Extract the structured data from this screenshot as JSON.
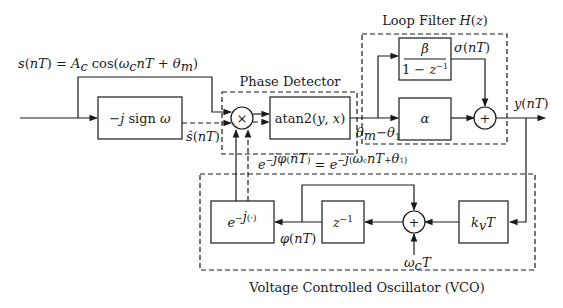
{
  "diagram": {
    "type": "block-diagram",
    "groups": {
      "phase_detector": "Phase Detector",
      "loop_filter": "Loop Filter H(z)",
      "vco": "Voltage Controlled Oscillator (VCO)"
    },
    "signals": {
      "input": "s(nT) = A_c cos(ω_c nT + θ_m)",
      "hilbert_out": "ŝ(nT)",
      "phase_error": "θ_m − θ_1",
      "integrator_out": "σ(nT)",
      "filter_out": "y(nT)",
      "vco_phase": "φ(nT)",
      "vco_out": "e^{−jφ(nT)} = e^{−j(ω_c nT + θ_1)}",
      "carrier_term": "ω_c T"
    },
    "blocks": {
      "hilbert": "−j sign ω",
      "multiplier": "×",
      "atan2": "atan2(y, x)",
      "integrator_num": "β",
      "integrator_den": "1 − z⁻¹",
      "proportional": "α",
      "filter_sum": "+",
      "vco_gain": "k_v T",
      "vco_sum": "+",
      "delay": "z⁻¹",
      "exp": "e^{−j(·)}"
    }
  }
}
